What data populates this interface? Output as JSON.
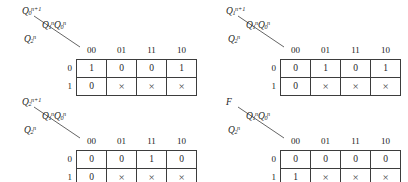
{
  "figure": {
    "column_header_label": "Q1nQ0n",
    "row_header_label": "Q2n",
    "columns": [
      "00",
      "01",
      "11",
      "10"
    ],
    "rows": [
      "0",
      "1"
    ],
    "dont_care_symbol": "×"
  },
  "maps": [
    {
      "id": "map-q0-next",
      "output_label_base": "Q",
      "output_label_sub": "0",
      "output_label_sup": "n+1",
      "col_label_base1": "Q",
      "col_label_sub1": "1",
      "col_label_sup1": "n",
      "col_label_base2": "Q",
      "col_label_sub2": "0",
      "col_label_sup2": "n",
      "row_label_base": "Q",
      "row_label_sub": "2",
      "row_label_sup": "n",
      "columns": [
        "00",
        "01",
        "11",
        "10"
      ],
      "rows": [
        {
          "label": "0",
          "values": [
            "1",
            "0",
            "0",
            "1"
          ]
        },
        {
          "label": "1",
          "values": [
            "0",
            "×",
            "×",
            "×"
          ]
        }
      ]
    },
    {
      "id": "map-q1-next",
      "output_label_base": "Q",
      "output_label_sub": "1",
      "output_label_sup": "n+1",
      "col_label_base1": "Q",
      "col_label_sub1": "1",
      "col_label_sup1": "n",
      "col_label_base2": "Q",
      "col_label_sub2": "0",
      "col_label_sup2": "n",
      "row_label_base": "Q",
      "row_label_sub": "2",
      "row_label_sup": "n",
      "columns": [
        "00",
        "01",
        "11",
        "10"
      ],
      "rows": [
        {
          "label": "0",
          "values": [
            "0",
            "1",
            "0",
            "1"
          ]
        },
        {
          "label": "1",
          "values": [
            "0",
            "×",
            "×",
            "×"
          ]
        }
      ]
    },
    {
      "id": "map-q2-next",
      "output_label_base": "Q",
      "output_label_sub": "2",
      "output_label_sup": "n+1",
      "col_label_base1": "Q",
      "col_label_sub1": "1",
      "col_label_sup1": "n",
      "col_label_base2": "Q",
      "col_label_sub2": "0",
      "col_label_sup2": "n",
      "row_label_base": "Q",
      "row_label_sub": "2",
      "row_label_sup": "n",
      "columns": [
        "00",
        "01",
        "11",
        "10"
      ],
      "rows": [
        {
          "label": "0",
          "values": [
            "0",
            "0",
            "1",
            "0"
          ]
        },
        {
          "label": "1",
          "values": [
            "0",
            "×",
            "×",
            "×"
          ]
        }
      ]
    },
    {
      "id": "map-f",
      "output_label_base": "F",
      "output_label_sub": "",
      "output_label_sup": "",
      "col_label_base1": "Q",
      "col_label_sub1": "1",
      "col_label_sup1": "n",
      "col_label_base2": "Q",
      "col_label_sub2": "0",
      "col_label_sup2": "n",
      "row_label_base": "Q",
      "row_label_sub": "2",
      "row_label_sup": "n",
      "columns": [
        "00",
        "01",
        "11",
        "10"
      ],
      "rows": [
        {
          "label": "0",
          "values": [
            "0",
            "0",
            "0",
            "0"
          ]
        },
        {
          "label": "1",
          "values": [
            "1",
            "×",
            "×",
            "×"
          ]
        }
      ]
    }
  ],
  "colors": {
    "grid_line": "#3d3d3d",
    "text": "#1c1c1c",
    "background": "#ffffff"
  }
}
